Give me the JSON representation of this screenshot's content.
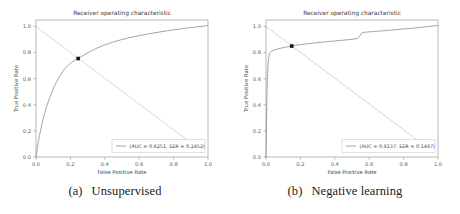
{
  "figure": {
    "panels": [
      {
        "caption_tag": "(a)",
        "caption_text": "Unsupervised",
        "chart_data": {
          "type": "line",
          "title": "Receiver operating characteristic",
          "xlabel": "False Positive Rate",
          "ylabel": "True Positive Rate",
          "xlim": [
            0.0,
            1.0
          ],
          "ylim": [
            0.0,
            1.05
          ],
          "xticks": [
            "0.0",
            "0.2",
            "0.4",
            "0.6",
            "0.8",
            "1.0"
          ],
          "yticks": [
            "0.0",
            "0.2",
            "0.4",
            "0.6",
            "0.8",
            "1.0"
          ],
          "grid": false,
          "legend_position": "lower right",
          "legend_label": "(AUC = 0.8251, EER = 0.2452)",
          "auc": 0.8251,
          "eer": 0.2452,
          "curve_color": "#8a8f99",
          "diagonal_color": "#b9bcc4",
          "marker_color": "#141414",
          "eer_point": {
            "x": 0.2452,
            "y": 0.7548
          },
          "series": [
            {
              "name": "roc",
              "points": [
                [
                  0.0,
                  0.0
                ],
                [
                  0.005,
                  0.045
                ],
                [
                  0.012,
                  0.105
                ],
                [
                  0.02,
                  0.165
                ],
                [
                  0.03,
                  0.225
                ],
                [
                  0.04,
                  0.285
                ],
                [
                  0.052,
                  0.345
                ],
                [
                  0.065,
                  0.4
                ],
                [
                  0.08,
                  0.455
                ],
                [
                  0.095,
                  0.505
                ],
                [
                  0.11,
                  0.55
                ],
                [
                  0.125,
                  0.59
                ],
                [
                  0.14,
                  0.625
                ],
                [
                  0.155,
                  0.655
                ],
                [
                  0.17,
                  0.68
                ],
                [
                  0.185,
                  0.7
                ],
                [
                  0.2,
                  0.718
                ],
                [
                  0.215,
                  0.732
                ],
                [
                  0.23,
                  0.744
                ],
                [
                  0.245,
                  0.755
                ],
                [
                  0.265,
                  0.77
                ],
                [
                  0.29,
                  0.79
                ],
                [
                  0.32,
                  0.812
                ],
                [
                  0.355,
                  0.835
                ],
                [
                  0.395,
                  0.857
                ],
                [
                  0.44,
                  0.878
                ],
                [
                  0.49,
                  0.897
                ],
                [
                  0.545,
                  0.915
                ],
                [
                  0.6,
                  0.93
                ],
                [
                  0.655,
                  0.944
                ],
                [
                  0.71,
                  0.956
                ],
                [
                  0.765,
                  0.968
                ],
                [
                  0.82,
                  0.978
                ],
                [
                  0.875,
                  0.988
                ],
                [
                  0.93,
                  0.996
                ],
                [
                  0.97,
                  1.002
                ],
                [
                  1.0,
                  1.008
                ]
              ]
            }
          ],
          "reference_line": {
            "name": "diagonal",
            "points": [
              [
                0.0,
                1.0
              ],
              [
                0.92,
                0.09
              ]
            ]
          }
        }
      },
      {
        "caption_tag": "(b)",
        "caption_text": "Negative learning",
        "chart_data": {
          "type": "line",
          "title": "Receiver operating characteristic",
          "xlabel": "False Positive Rate",
          "ylabel": "True Positive Rate",
          "xlim": [
            0.0,
            1.0
          ],
          "ylim": [
            0.0,
            1.05
          ],
          "xticks": [
            "0.0",
            "0.2",
            "0.4",
            "0.6",
            "0.8",
            "1.0"
          ],
          "yticks": [
            "0.0",
            "0.2",
            "0.4",
            "0.6",
            "0.8",
            "1.0"
          ],
          "grid": false,
          "legend_position": "lower right",
          "legend_label": "(AUC = 0.9137, EER = 0.1497)",
          "auc": 0.9137,
          "eer": 0.1497,
          "curve_color": "#8a8f99",
          "diagonal_color": "#b9bcc4",
          "marker_color": "#141414",
          "eer_point": {
            "x": 0.1497,
            "y": 0.8503
          },
          "series": [
            {
              "name": "roc",
              "points": [
                [
                  0.0,
                  0.0
                ],
                [
                  0.002,
                  0.18
                ],
                [
                  0.004,
                  0.36
                ],
                [
                  0.006,
                  0.52
                ],
                [
                  0.009,
                  0.64
                ],
                [
                  0.012,
                  0.715
                ],
                [
                  0.016,
                  0.762
                ],
                [
                  0.02,
                  0.79
                ],
                [
                  0.026,
                  0.805
                ],
                [
                  0.034,
                  0.813
                ],
                [
                  0.045,
                  0.819
                ],
                [
                  0.06,
                  0.825
                ],
                [
                  0.075,
                  0.83
                ],
                [
                  0.09,
                  0.835
                ],
                [
                  0.105,
                  0.839
                ],
                [
                  0.12,
                  0.843
                ],
                [
                  0.135,
                  0.847
                ],
                [
                  0.15,
                  0.85
                ],
                [
                  0.175,
                  0.856
                ],
                [
                  0.2,
                  0.861
                ],
                [
                  0.235,
                  0.867
                ],
                [
                  0.27,
                  0.872
                ],
                [
                  0.31,
                  0.878
                ],
                [
                  0.35,
                  0.883
                ],
                [
                  0.39,
                  0.888
                ],
                [
                  0.43,
                  0.893
                ],
                [
                  0.47,
                  0.898
                ],
                [
                  0.505,
                  0.903
                ],
                [
                  0.53,
                  0.908
                ],
                [
                  0.545,
                  0.925
                ],
                [
                  0.555,
                  0.948
                ],
                [
                  0.565,
                  0.955
                ],
                [
                  0.59,
                  0.958
                ],
                [
                  0.63,
                  0.962
                ],
                [
                  0.68,
                  0.967
                ],
                [
                  0.73,
                  0.973
                ],
                [
                  0.79,
                  0.98
                ],
                [
                  0.85,
                  0.987
                ],
                [
                  0.91,
                  0.995
                ],
                [
                  0.96,
                  1.002
                ],
                [
                  1.0,
                  1.008
                ]
              ]
            }
          ],
          "reference_line": {
            "name": "diagonal",
            "points": [
              [
                0.0,
                1.0
              ],
              [
                0.92,
                0.09
              ]
            ]
          }
        }
      }
    ]
  }
}
